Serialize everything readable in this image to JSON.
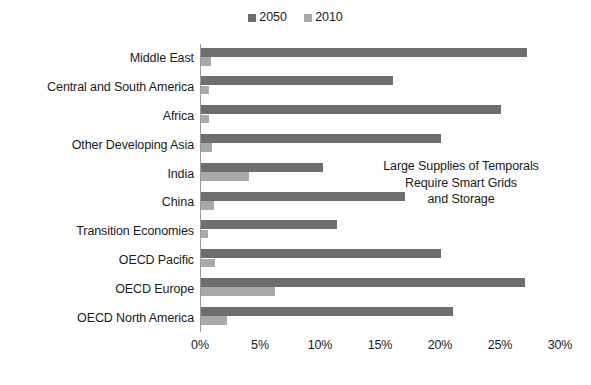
{
  "legend": {
    "entries": [
      {
        "label": "2050",
        "color": "#6e6e6e"
      },
      {
        "label": "2010",
        "color": "#a9a9a9"
      }
    ]
  },
  "annotation": {
    "line1": "Large Supplies of Temporals",
    "line2": "Require Smart Grids",
    "line3": "and Storage"
  },
  "axis": {
    "ticks": [
      "0%",
      "5%",
      "10%",
      "15%",
      "20%",
      "25%",
      "30%"
    ]
  },
  "chart_data": {
    "type": "bar",
    "orientation": "horizontal",
    "title": "",
    "xlabel": "",
    "ylabel": "",
    "xlim": [
      0,
      30
    ],
    "xtick_values": [
      0,
      5,
      10,
      15,
      20,
      25,
      30
    ],
    "xtick_labels": [
      "0%",
      "5%",
      "10%",
      "15%",
      "20%",
      "25%",
      "30%"
    ],
    "grid": false,
    "legend_position": "top-center",
    "categories": [
      "Middle East",
      "Central and South America",
      "Africa",
      "Other Developing Asia",
      "India",
      "China",
      "Transition Economies",
      "OECD Pacific",
      "OECD Europe",
      "OECD North America"
    ],
    "series": [
      {
        "name": "2050",
        "color": "#6e6e6e",
        "values": [
          27.2,
          16.0,
          25.0,
          20.0,
          10.2,
          17.0,
          11.3,
          20.0,
          27.0,
          21.0
        ]
      },
      {
        "name": "2010",
        "color": "#a9a9a9",
        "values": [
          0.8,
          0.7,
          0.7,
          0.9,
          4.0,
          1.1,
          0.6,
          1.2,
          6.2,
          2.2
        ]
      }
    ],
    "annotations": [
      "Large Supplies of Temporals",
      "Require Smart Grids",
      "and Storage"
    ]
  }
}
